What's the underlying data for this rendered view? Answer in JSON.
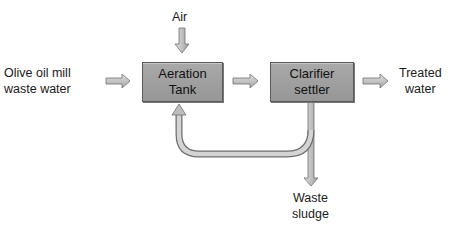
{
  "diagram": {
    "nodes": {
      "input": {
        "line1": "Olive oil mill",
        "line2": "waste water"
      },
      "air": {
        "label": "Air"
      },
      "aeration_tank": {
        "line1": "Aeration",
        "line2": "Tank"
      },
      "clarifier": {
        "line1": "Clarifier",
        "line2": "settler"
      },
      "output": {
        "line1": "Treated",
        "line2": "water"
      },
      "waste": {
        "line1": "Waste",
        "line2": "sludge"
      }
    },
    "edges": [
      {
        "from": "input",
        "to": "aeration_tank"
      },
      {
        "from": "air",
        "to": "aeration_tank"
      },
      {
        "from": "aeration_tank",
        "to": "clarifier"
      },
      {
        "from": "clarifier",
        "to": "output"
      },
      {
        "from": "clarifier",
        "to": "aeration_tank",
        "type": "recycle"
      },
      {
        "from": "clarifier",
        "to": "waste"
      }
    ],
    "colors": {
      "box_fill": "#a0a0a0",
      "box_border": "#5a5a5a",
      "arrow_fill": "#c4c4c4",
      "arrow_stroke": "#6e6e6e"
    }
  }
}
